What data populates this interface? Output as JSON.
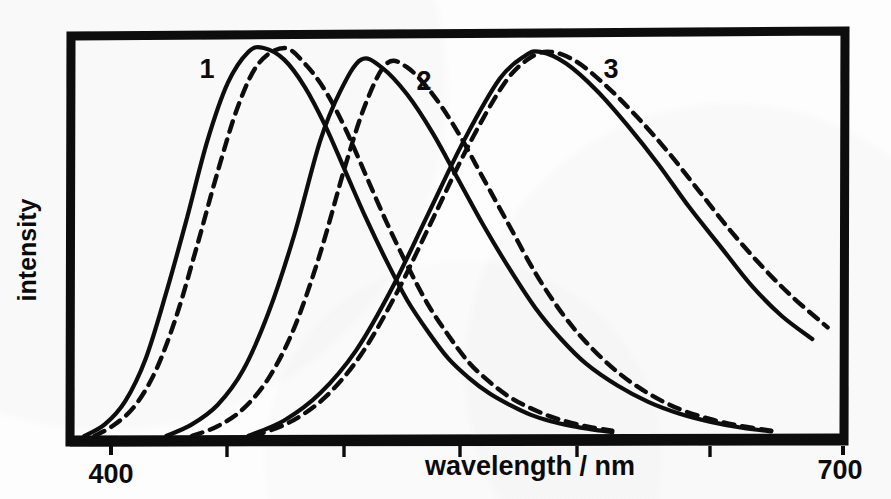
{
  "figure": {
    "background_color": "#fdfdfd",
    "ink_color": "#0b0b0b",
    "frame": {
      "x": 70,
      "y": 31,
      "width": 775,
      "height": 411,
      "border_width": 9,
      "style": "hand-drawn thick black rectangle"
    }
  },
  "axes": {
    "x": {
      "title": "wavelength / nm",
      "title_x": 530,
      "title_y": 475,
      "min": 400,
      "max": 700,
      "tick_labels": [
        "400",
        "700"
      ],
      "tick_label_positions": [
        400,
        700
      ],
      "minor_tick_values": [
        450,
        500,
        550,
        600,
        650
      ],
      "tick_pixel_positions": [
        111,
        227,
        344,
        460,
        577,
        710,
        843
      ],
      "tick_length": 11
    },
    "y": {
      "title": "intensity",
      "title_x": 36,
      "title_y": 250,
      "rotation": -90,
      "ticks": [],
      "tick_labels": []
    }
  },
  "chart_data": {
    "type": "line",
    "title": "",
    "subtitle": "",
    "xlabel": "wavelength / nm",
    "ylabel": "intensity",
    "xlim": [
      400,
      700
    ],
    "ylim": [
      0,
      1.05
    ],
    "grid": false,
    "legend": "inline curve labels 1, 2, 3",
    "x_tick_labels": [
      "400",
      "700"
    ],
    "annotations": [
      {
        "text": "1",
        "x": 430,
        "y": 0.9,
        "px": 207,
        "py": 78,
        "describes": "short-wavelength band"
      },
      {
        "text": "2",
        "x": 522,
        "y": 0.8,
        "px": 424,
        "py": 90,
        "describes": "middle-wavelength band"
      },
      {
        "text": "3",
        "x": 625,
        "y": 0.84,
        "px": 611,
        "py": 78,
        "describes": "long-wavelength band"
      }
    ],
    "series": [
      {
        "name": "1 solid",
        "label": "1",
        "band": 1,
        "style": "solid",
        "peak_nm": 474,
        "peak_intensity": 1.0,
        "onset_nm": 408,
        "x": [
          404,
          412,
          420,
          428,
          436,
          444,
          452,
          460,
          468,
          474,
          482,
          490,
          498,
          506,
          514,
          522,
          530,
          538,
          546,
          554,
          562,
          570,
          578,
          586,
          594,
          602,
          610
        ],
        "values": [
          0.0,
          0.03,
          0.09,
          0.2,
          0.37,
          0.56,
          0.76,
          0.91,
          0.99,
          1.0,
          0.97,
          0.9,
          0.8,
          0.68,
          0.56,
          0.45,
          0.35,
          0.27,
          0.2,
          0.15,
          0.11,
          0.08,
          0.055,
          0.038,
          0.026,
          0.017,
          0.01
        ]
      },
      {
        "name": "1 dashed",
        "label": "1",
        "band": 1,
        "style": "dashed",
        "peak_nm": 482,
        "peak_intensity": 1.0,
        "onset_nm": 414,
        "x": [
          408,
          416,
          424,
          432,
          440,
          448,
          456,
          464,
          472,
          482,
          490,
          498,
          506,
          514,
          522,
          530,
          538,
          546,
          554,
          562,
          570,
          578,
          586,
          594,
          602,
          610
        ],
        "values": [
          0.0,
          0.03,
          0.08,
          0.17,
          0.31,
          0.49,
          0.68,
          0.85,
          0.96,
          1.0,
          0.96,
          0.89,
          0.79,
          0.67,
          0.55,
          0.44,
          0.34,
          0.26,
          0.19,
          0.14,
          0.1,
          0.072,
          0.05,
          0.034,
          0.022,
          0.014
        ]
      },
      {
        "name": "2 solid",
        "label": "2",
        "band": 2,
        "style": "solid",
        "peak_nm": 512,
        "peak_intensity": 0.97,
        "onset_nm": 438,
        "x": [
          436,
          446,
          456,
          466,
          476,
          486,
          496,
          504,
          512,
          520,
          530,
          540,
          550,
          560,
          570,
          580,
          590,
          600,
          612,
          624,
          636,
          648,
          660,
          672
        ],
        "values": [
          0.0,
          0.03,
          0.08,
          0.17,
          0.32,
          0.52,
          0.76,
          0.89,
          0.97,
          0.95,
          0.88,
          0.78,
          0.66,
          0.54,
          0.43,
          0.33,
          0.25,
          0.185,
          0.13,
          0.088,
          0.058,
          0.037,
          0.022,
          0.012
        ]
      },
      {
        "name": "2 dashed",
        "label": "2",
        "band": 2,
        "style": "dashed",
        "peak_nm": 520,
        "peak_intensity": 0.97,
        "onset_nm": 450,
        "x": [
          446,
          456,
          466,
          476,
          486,
          496,
          506,
          514,
          522,
          530,
          540,
          550,
          560,
          570,
          580,
          590,
          600,
          612,
          624,
          636,
          648,
          660,
          672
        ],
        "values": [
          0.0,
          0.025,
          0.07,
          0.15,
          0.28,
          0.47,
          0.7,
          0.86,
          0.96,
          0.95,
          0.88,
          0.78,
          0.66,
          0.54,
          0.42,
          0.32,
          0.24,
          0.165,
          0.11,
          0.07,
          0.044,
          0.026,
          0.014
        ]
      },
      {
        "name": "3 solid",
        "label": "3",
        "band": 3,
        "style": "solid",
        "peak_nm": 582,
        "peak_intensity": 0.99,
        "onset_nm": 470,
        "x": [
          468,
          482,
          496,
          510,
          524,
          538,
          552,
          566,
          576,
          582,
          592,
          604,
          616,
          628,
          640,
          652,
          664,
          676,
          688
        ],
        "values": [
          0.0,
          0.04,
          0.11,
          0.22,
          0.38,
          0.57,
          0.76,
          0.92,
          0.98,
          0.99,
          0.96,
          0.89,
          0.8,
          0.7,
          0.59,
          0.49,
          0.39,
          0.31,
          0.25
        ]
      },
      {
        "name": "3 dashed",
        "label": "3",
        "band": 3,
        "style": "dashed",
        "peak_nm": 586,
        "peak_intensity": 0.99,
        "onset_nm": 474,
        "x": [
          470,
          484,
          498,
          512,
          526,
          540,
          554,
          568,
          578,
          586,
          596,
          608,
          620,
          632,
          644,
          656,
          668,
          680,
          694
        ],
        "values": [
          0.0,
          0.035,
          0.1,
          0.21,
          0.37,
          0.56,
          0.75,
          0.91,
          0.975,
          0.99,
          0.965,
          0.9,
          0.82,
          0.73,
          0.63,
          0.53,
          0.44,
          0.36,
          0.28
        ]
      }
    ]
  }
}
